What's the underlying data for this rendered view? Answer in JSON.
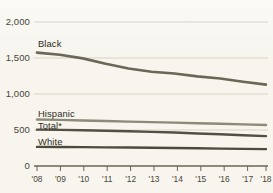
{
  "chart_data": {
    "type": "line",
    "title": "",
    "subtitle": "",
    "xlabel": "",
    "ylabel": "",
    "grid": true,
    "legend_position": "inline-labels",
    "x": [
      "'08",
      "'09",
      "'10",
      "'11",
      "'12",
      "'13",
      "'14",
      "'15",
      "'16",
      "'17",
      "'18"
    ],
    "xlim": [
      "'08",
      "'18"
    ],
    "ylim": [
      0,
      2000
    ],
    "yticks": [
      0,
      500,
      1000,
      1500,
      2000
    ],
    "ytick_labels": [
      "0",
      "500",
      "1,000",
      "1,500",
      "2,000"
    ],
    "series": [
      {
        "name": "Black",
        "color": "#6b6655",
        "values": [
          1575,
          1545,
          1495,
          1420,
          1355,
          1310,
          1285,
          1245,
          1215,
          1170,
          1130
        ]
      },
      {
        "name": "Hispanic",
        "color": "#8d8a77",
        "values": [
          645,
          640,
          632,
          624,
          616,
          610,
          602,
          594,
          586,
          578,
          570
        ]
      },
      {
        "name": "Total*",
        "color": "#544f42",
        "values": [
          505,
          502,
          497,
          490,
          482,
          474,
          466,
          452,
          440,
          428,
          415
        ]
      },
      {
        "name": "White",
        "color": "#4e4a3e",
        "values": [
          265,
          264,
          262,
          259,
          256,
          253,
          250,
          246,
          242,
          238,
          235
        ]
      }
    ]
  },
  "axis": {
    "ytick_labels": [
      "2,000",
      "1,500",
      "1,000",
      "500",
      "0"
    ],
    "xtick_labels": [
      "'08",
      "'09",
      "'10",
      "'11",
      "'12",
      "'13",
      "'14",
      "'15",
      "'16",
      "'17",
      "'18"
    ]
  },
  "labels": {
    "black": "Black",
    "hispanic": "Hispanic",
    "total": "Total*",
    "white": "White"
  },
  "colors": {
    "background": "#f7f5ee",
    "ink": "#4a4539",
    "gridline": "#cfcbba",
    "axis": "#6b6655"
  }
}
